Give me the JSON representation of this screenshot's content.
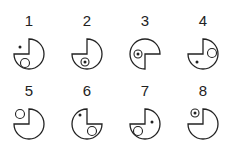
{
  "figures": [
    {
      "label": "1",
      "cx": 29,
      "cy": 54,
      "missing": "top-left",
      "items": [
        {
          "type": "dot",
          "x": 20,
          "y": 47
        },
        {
          "type": "ring",
          "x": 25,
          "y": 63
        }
      ]
    },
    {
      "label": "2",
      "cx": 87,
      "cy": 54,
      "missing": "top-left",
      "items": [
        {
          "type": "ring-dot",
          "x": 85,
          "y": 62
        }
      ]
    },
    {
      "label": "3",
      "cx": 145,
      "cy": 54,
      "missing": "bottom-right",
      "items": [
        {
          "type": "ring-dot",
          "x": 138,
          "y": 54
        }
      ]
    },
    {
      "label": "4",
      "cx": 203,
      "cy": 54,
      "missing": "top-left",
      "items": [
        {
          "type": "ring",
          "x": 212,
          "y": 53
        },
        {
          "type": "dot",
          "x": 197,
          "y": 62
        }
      ]
    },
    {
      "label": "5",
      "cx": 29,
      "cy": 124,
      "missing": "top-left",
      "items": [
        {
          "type": "ring",
          "x": 20,
          "y": 114
        }
      ]
    },
    {
      "label": "6",
      "cx": 87,
      "cy": 124,
      "missing": "top-right",
      "items": [
        {
          "type": "dot",
          "x": 80,
          "y": 115
        },
        {
          "type": "ring",
          "x": 92,
          "y": 131
        }
      ]
    },
    {
      "label": "7",
      "cx": 145,
      "cy": 124,
      "missing": "top-left",
      "items": [
        {
          "type": "ring",
          "x": 138,
          "y": 131
        },
        {
          "type": "dot",
          "x": 152,
          "y": 122
        }
      ]
    },
    {
      "label": "8",
      "cx": 203,
      "cy": 124,
      "missing": "top-left",
      "items": [
        {
          "type": "ring-dot",
          "x": 195,
          "y": 113
        }
      ]
    }
  ],
  "style": {
    "stroke": "#222222",
    "radius": 15
  }
}
